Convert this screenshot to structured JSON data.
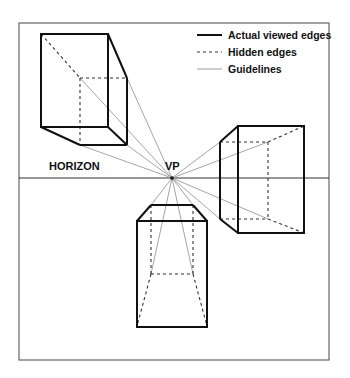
{
  "diagram": {
    "legend": {
      "items": [
        {
          "label": "Actual viewed edges",
          "style": "solid"
        },
        {
          "label": "Hidden edges",
          "style": "dashed"
        },
        {
          "label": "Guidelines",
          "style": "guide"
        }
      ]
    },
    "labels": {
      "horizon": "HORIZON",
      "vanishing_point": "VP"
    },
    "colors": {
      "edge": "#111111",
      "hidden": "#333333",
      "guide": "#9a9a9a",
      "frame": "#666666"
    },
    "vanishing_point": {
      "x": 172,
      "y": 178
    },
    "boxes": [
      {
        "name": "upper-left-box",
        "position": "above-left of horizon"
      },
      {
        "name": "right-box",
        "position": "straddling horizon, right"
      },
      {
        "name": "lower-box",
        "position": "below horizon, center"
      }
    ]
  }
}
